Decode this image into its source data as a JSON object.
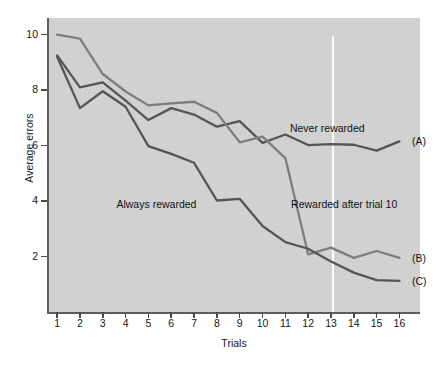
{
  "chart_data": {
    "type": "line",
    "title": "",
    "xlabel": "Trials",
    "ylabel": "Average errors",
    "x": [
      1,
      2,
      3,
      4,
      5,
      6,
      7,
      8,
      9,
      10,
      11,
      12,
      13,
      14,
      15,
      16
    ],
    "xlim": [
      0.6,
      16.9
    ],
    "ylim": [
      0,
      10.6
    ],
    "xticks": [
      1,
      2,
      3,
      4,
      5,
      6,
      7,
      8,
      9,
      10,
      11,
      12,
      13,
      14,
      15,
      16
    ],
    "xticklabels": [
      "1",
      "2",
      "3",
      "4",
      "5",
      "6",
      "7",
      "8",
      "9",
      "10",
      "11",
      "12",
      "13",
      "14",
      "15",
      "16"
    ],
    "yticks": [
      2,
      4,
      6,
      8,
      10
    ],
    "yticklabels": [
      "2",
      "4",
      "6",
      "8",
      "10"
    ],
    "grid": false,
    "legend_position": "inline-annotations",
    "plot_background": "#d3d3d3",
    "figure_background": "#ffffff",
    "series": [
      {
        "name": "Never rewarded",
        "key": "A",
        "end_label": "(A)",
        "color": "#555555",
        "width": 2.3,
        "values": [
          9.25,
          8.1,
          8.28,
          7.62,
          6.92,
          7.35,
          7.12,
          6.68,
          6.88,
          6.1,
          6.4,
          6.02,
          6.05,
          6.03,
          5.82,
          6.15
        ]
      },
      {
        "name": "Rewarded after trial 10",
        "key": "B",
        "end_label": "(B)",
        "color": "#7d7d7d",
        "width": 2.3,
        "values": [
          10.0,
          9.86,
          8.58,
          7.95,
          7.45,
          7.52,
          7.58,
          7.18,
          6.12,
          6.32,
          5.55,
          2.08,
          2.32,
          1.95,
          2.2,
          1.95
        ]
      },
      {
        "name": "Always rewarded",
        "key": "C",
        "end_label": "(C)",
        "color": "#555555",
        "width": 2.3,
        "values": [
          9.2,
          7.35,
          7.96,
          7.4,
          5.98,
          5.7,
          5.38,
          4.02,
          4.08,
          3.1,
          2.52,
          2.28,
          1.82,
          1.42,
          1.15,
          1.12
        ]
      }
    ],
    "annotations": [
      {
        "id": "never-rewarded",
        "text": "Never rewarded",
        "x": 11.2,
        "y": 6.62
      },
      {
        "id": "always-rewarded",
        "text": "Always rewarded",
        "x": 3.6,
        "y": 3.88
      },
      {
        "id": "rewarded-after-trial-10",
        "text": "Rewarded after trial 10",
        "x": 11.25,
        "y": 3.88
      }
    ],
    "end_labels": [
      {
        "id": "end-label-a",
        "text": "(A)",
        "x": 16.55,
        "y": 6.15
      },
      {
        "id": "end-label-b",
        "text": "(B)",
        "x": 16.55,
        "y": 1.95
      },
      {
        "id": "end-label-c",
        "text": "(C)",
        "x": 16.55,
        "y": 1.12
      }
    ],
    "vline": {
      "id": "trial-11-divider",
      "x": 11,
      "color": "#ffffff",
      "width": 2.0
    }
  }
}
